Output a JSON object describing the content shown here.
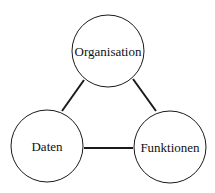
{
  "diagram": {
    "nodes": [
      {
        "id": "organisation",
        "label": "Organisation",
        "cx": 108,
        "cy": 51,
        "r": 37
      },
      {
        "id": "daten",
        "label": "Daten",
        "cx": 47,
        "cy": 146,
        "r": 37
      },
      {
        "id": "funktionen",
        "label": "Funktionen",
        "cx": 170,
        "cy": 147,
        "r": 37
      }
    ],
    "edges": [
      {
        "from": "organisation",
        "to": "daten"
      },
      {
        "from": "organisation",
        "to": "funktionen"
      },
      {
        "from": "daten",
        "to": "funktionen"
      }
    ],
    "colors": {
      "stroke": "#1a1a1a",
      "background": "#ffffff"
    }
  }
}
